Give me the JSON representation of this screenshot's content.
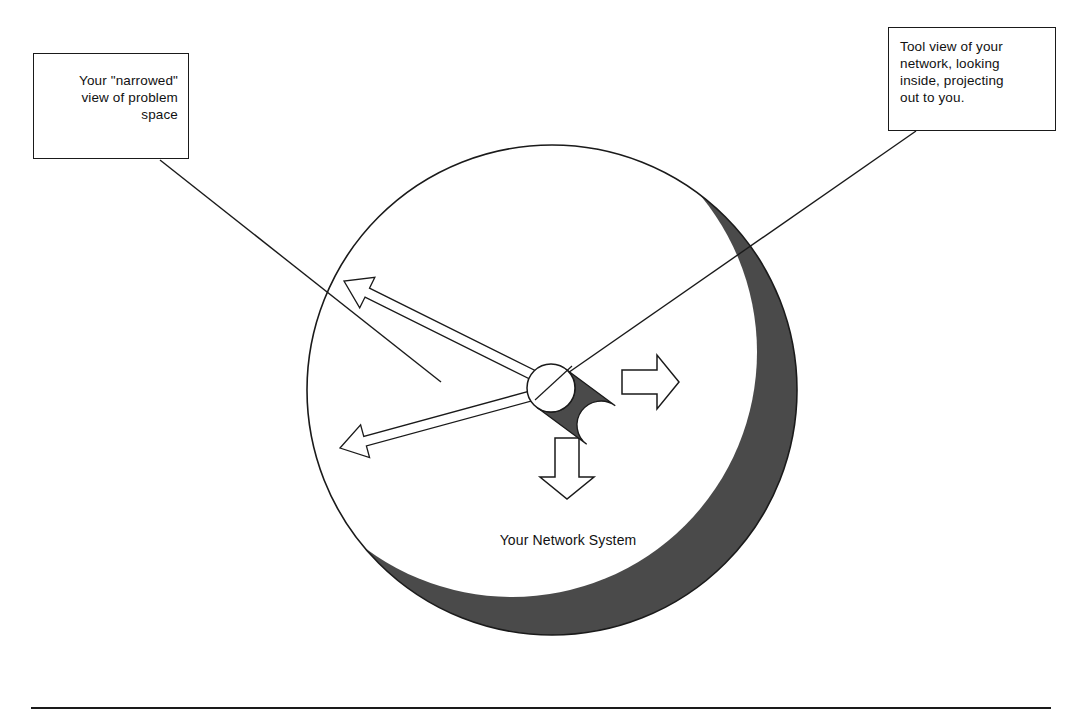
{
  "page": {
    "background_color": "#ffffff",
    "stroke_color": "#1a1a1a",
    "shadow_color": "#4a4a4a",
    "width": 1082,
    "height": 718
  },
  "callouts": {
    "left": {
      "name": "narrowed-view-callout",
      "align": "right",
      "lines": [
        "Your \"narrowed\"",
        "view of problem",
        "space"
      ],
      "box": {
        "x": 33,
        "y": 53,
        "w": 156,
        "h": 106
      },
      "leader": {
        "x1": 160,
        "y1": 160,
        "x2": 441,
        "y2": 382
      }
    },
    "right": {
      "name": "tool-view-callout",
      "align": "left",
      "lines": [
        "Tool view of your",
        "network, looking",
        "inside, projecting",
        "out to you."
      ],
      "box": {
        "x": 888,
        "y": 27,
        "w": 168,
        "h": 104
      },
      "leader": {
        "x1": 916,
        "y1": 131,
        "x2": 552,
        "y2": 384
      }
    }
  },
  "diagram": {
    "system_circle": {
      "label": "Your Network System",
      "cx": 552,
      "cy": 390,
      "r": 245,
      "fill": "#ffffff",
      "stroke": "#1a1a1a",
      "stroke_width": 1.6
    },
    "shadow_crescent": {
      "name": "crescent-shadow",
      "fill": "#4a4a4a",
      "outer_cx": 552,
      "outer_cy": 390,
      "outer_r": 245,
      "inner_cx": 512,
      "inner_cy": 352,
      "inner_r": 245
    },
    "viewer_cylinder": {
      "name": "viewer-cylinder",
      "cap_cx": 551,
      "cap_cy": 388,
      "cap_r": 24,
      "cap_fill": "#ffffff",
      "body_fill": "#4a4a4a",
      "body_end_cx": 601,
      "body_end_cy": 425,
      "tick": {
        "x1": 535,
        "y1": 400,
        "x2": 572,
        "y2": 366
      }
    },
    "label_text": "Your Network System",
    "label_position": {
      "x": 580,
      "y": 543
    }
  },
  "arrows": [
    {
      "name": "arrow-up-left",
      "style": "outline-thin",
      "from": {
        "x": 549,
        "y": 383
      },
      "to": {
        "x": 344,
        "y": 281
      },
      "head_len": 26,
      "head_w": 17,
      "shaft_w": 5
    },
    {
      "name": "arrow-down-left",
      "style": "outline-thin",
      "from": {
        "x": 549,
        "y": 391
      },
      "to": {
        "x": 340,
        "y": 448
      },
      "head_len": 26,
      "head_w": 17,
      "shaft_w": 5
    },
    {
      "name": "arrow-right",
      "style": "outline-block",
      "from": {
        "x": 622,
        "y": 382
      },
      "to": {
        "x": 679,
        "y": 382
      },
      "head_len": 22,
      "head_w": 27,
      "shaft_w": 12
    },
    {
      "name": "arrow-down",
      "style": "outline-block",
      "from": {
        "x": 567,
        "y": 438
      },
      "to": {
        "x": 567,
        "y": 499
      },
      "head_len": 22,
      "head_w": 27,
      "shaft_w": 12
    }
  ],
  "footer_rule": {
    "name": "footer-divider",
    "x1": 31,
    "y1": 708,
    "x2": 1051,
    "y2": 708,
    "stroke": "#1a1a1a",
    "stroke_width": 1.8
  }
}
